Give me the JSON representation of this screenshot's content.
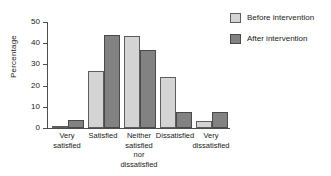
{
  "chart_data": {
    "type": "bar",
    "title": "",
    "subtitle": "",
    "xlabel": "",
    "ylabel": "Percentage",
    "ylim": [
      0,
      50
    ],
    "yticks": [
      0,
      10,
      20,
      30,
      40,
      50
    ],
    "ytick_labels": [
      "0",
      "10",
      "20",
      "30",
      "40",
      "50"
    ],
    "grid": false,
    "legend_position": "top-right",
    "orientation": "vertical",
    "grouping": "grouped",
    "categories": [
      "Very\nsatisfied",
      "Satisfied",
      "Neither\nsatisfied\nnor\ndissatisfied",
      "Dissatisfied",
      "Very\ndissatisfied"
    ],
    "category_lines": [
      [
        "Very",
        "satisfied"
      ],
      [
        "Satisfied"
      ],
      [
        "Neither",
        "satisfied",
        "nor",
        "dissatisfied"
      ],
      [
        "Dissatisfied"
      ],
      [
        "Very",
        "dissatisfied"
      ]
    ],
    "series": [
      {
        "name": "Before intervention",
        "color": "#d4d4d4",
        "values": [
          0.5,
          27,
          43.5,
          24,
          3.5
        ]
      },
      {
        "name": "After intervention",
        "color": "#828282",
        "values": [
          4,
          44,
          37,
          7.5,
          7.5
        ]
      }
    ],
    "annotations": []
  },
  "legend": {
    "items": [
      {
        "label": "Before intervention",
        "color": "#d4d4d4"
      },
      {
        "label": "After intervention",
        "color": "#828282"
      }
    ]
  },
  "axis": {
    "y_title": "Percentage",
    "tick_0": "0",
    "tick_10": "10",
    "tick_20": "20",
    "tick_30": "30",
    "tick_40": "40",
    "tick_50": "50"
  },
  "xlabels": {
    "cat0_l0": "Very",
    "cat0_l1": "satisfied",
    "cat1_l0": "Satisfied",
    "cat2_l0": "Neither",
    "cat2_l1": "satisfied",
    "cat2_l2": "nor",
    "cat2_l3": "dissatisfied",
    "cat3_l0": "Dissatisfied",
    "cat4_l0": "Very",
    "cat4_l1": "dissatisfied"
  }
}
